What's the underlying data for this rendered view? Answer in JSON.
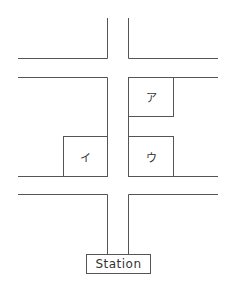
{
  "map": {
    "blocks": [
      {
        "id": "a",
        "label": "ア"
      },
      {
        "id": "i",
        "label": "イ"
      },
      {
        "id": "u",
        "label": "ウ"
      }
    ],
    "station_label": "Station"
  }
}
